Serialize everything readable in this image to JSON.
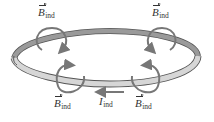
{
  "diagram": {
    "colors": {
      "background": "#ffffff",
      "ring_top": "#9a9a9a",
      "ring_bottom": "#d6d6d6",
      "ring_edge": "#555555",
      "field_arrow": "#777777",
      "label": "#333333"
    },
    "labels": {
      "b_top_left": {
        "symbol": "B",
        "subscript": "ind",
        "vector": true
      },
      "b_top_right": {
        "symbol": "B",
        "subscript": "ind",
        "vector": true
      },
      "b_bottom_left": {
        "symbol": "B",
        "subscript": "ind",
        "vector": true
      },
      "b_bottom_right": {
        "symbol": "B",
        "subscript": "ind",
        "vector": true
      },
      "current": {
        "symbol": "I",
        "subscript": "ind",
        "vector": false
      }
    },
    "current_direction": "left"
  }
}
